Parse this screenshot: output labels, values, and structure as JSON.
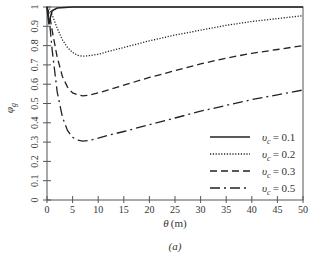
{
  "chart_data": {
    "type": "line",
    "title": "",
    "panel_label": "(a)",
    "xlabel": "θ (m)",
    "ylabel": "φ_g",
    "xlim": [
      0,
      50
    ],
    "ylim": [
      0,
      1
    ],
    "xticks": [
      0,
      5,
      10,
      15,
      20,
      25,
      30,
      35,
      40,
      45,
      50
    ],
    "yticks": [
      0,
      0.1,
      0.2,
      0.3,
      0.4,
      0.5,
      0.6,
      0.7,
      0.8,
      0.9,
      1
    ],
    "xtick_labels": [
      "0",
      "5",
      "10",
      "15",
      "20",
      "25",
      "30",
      "35",
      "40",
      "45",
      "50"
    ],
    "ytick_labels": [
      "0",
      "0.1",
      "0.2",
      "0.3",
      "0.4",
      "0.5",
      "0.6",
      "0.7",
      "0.8",
      "0.9",
      "1"
    ],
    "grid": false,
    "legend_position": "lower right",
    "series": [
      {
        "name": "υc = 0.1",
        "legend_label": "= 0.1",
        "style": "solid",
        "x": [
          0,
          0.2,
          0.4,
          0.6,
          1,
          2,
          5,
          10,
          20,
          30,
          40,
          50
        ],
        "y": [
          1.0,
          0.95,
          0.91,
          0.94,
          0.98,
          0.995,
          1.0,
          1.0,
          1.0,
          1.0,
          1.0,
          1.0
        ]
      },
      {
        "name": "υc = 0.2",
        "legend_label": "= 0.2",
        "style": "dotted",
        "x": [
          0,
          0.5,
          1,
          2,
          3,
          4,
          5,
          6,
          7,
          8,
          10,
          12,
          15,
          20,
          25,
          30,
          35,
          40,
          45,
          50
        ],
        "y": [
          1.0,
          0.99,
          0.96,
          0.89,
          0.83,
          0.79,
          0.765,
          0.75,
          0.745,
          0.747,
          0.755,
          0.77,
          0.79,
          0.825,
          0.855,
          0.88,
          0.905,
          0.925,
          0.94,
          0.955
        ]
      },
      {
        "name": "υc = 0.3",
        "legend_label": "= 0.3",
        "style": "dashed",
        "x": [
          0,
          0.5,
          1,
          2,
          3,
          4,
          5,
          6,
          7,
          8,
          10,
          12,
          15,
          20,
          25,
          30,
          35,
          40,
          45,
          50
        ],
        "y": [
          1.0,
          0.96,
          0.88,
          0.74,
          0.64,
          0.585,
          0.555,
          0.545,
          0.54,
          0.542,
          0.555,
          0.57,
          0.595,
          0.635,
          0.67,
          0.705,
          0.735,
          0.76,
          0.78,
          0.8
        ]
      },
      {
        "name": "υc = 0.5",
        "legend_label": "= 0.5",
        "style": "dash-dot",
        "x": [
          0,
          0.5,
          1,
          2,
          3,
          4,
          5,
          6,
          7,
          8,
          10,
          12,
          15,
          20,
          25,
          30,
          35,
          40,
          45,
          50
        ],
        "y": [
          1.0,
          0.92,
          0.78,
          0.56,
          0.43,
          0.36,
          0.325,
          0.31,
          0.305,
          0.308,
          0.32,
          0.335,
          0.355,
          0.39,
          0.425,
          0.46,
          0.49,
          0.52,
          0.545,
          0.57
        ]
      }
    ]
  },
  "legend": {
    "symbol": "υ",
    "subscript": "c",
    "items": [
      {
        "label": "= 0.1"
      },
      {
        "label": "= 0.2"
      },
      {
        "label": "= 0.3"
      },
      {
        "label": "= 0.5"
      }
    ]
  },
  "axes": {
    "xlabel_var": "θ",
    "xlabel_unit": "(m)",
    "ylabel_var": "φ",
    "ylabel_sub": "g",
    "caption": "(a)"
  }
}
